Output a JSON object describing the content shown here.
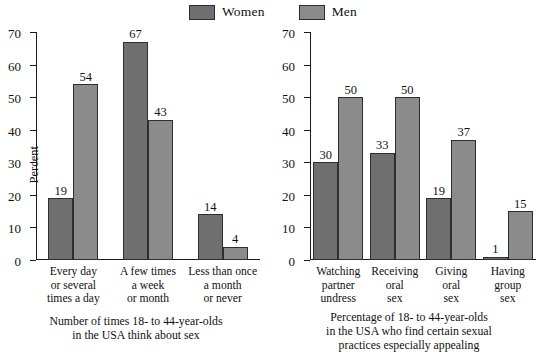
{
  "legend": {
    "items": [
      {
        "label": "Women",
        "color": "#6f6f6f",
        "key": "women"
      },
      {
        "label": "Men",
        "color": "#8b8b8b",
        "key": "men"
      }
    ]
  },
  "axis": {
    "ticks": [
      "70",
      "60",
      "50",
      "40",
      "30",
      "20",
      "10",
      "0"
    ],
    "ylabel": "Percent"
  },
  "panels": [
    {
      "id": "left",
      "ylabel": "Percent",
      "caption_line1": "Number of times 18- to 44-year-olds",
      "caption_line2": "in the USA think about sex",
      "caption_line3": "",
      "categories": [
        {
          "line1": "Every day",
          "line2": "or several",
          "line3": "times a day"
        },
        {
          "line1": "A few times",
          "line2": "a week",
          "line3": "or month"
        },
        {
          "line1": "Less than once",
          "line2": "a month",
          "line3": "or never"
        }
      ],
      "values": {
        "women": [
          19,
          67,
          14
        ],
        "men": [
          54,
          43,
          4
        ]
      },
      "labels": {
        "women": [
          "19",
          "67",
          "14"
        ],
        "men": [
          "54",
          "43",
          "4"
        ]
      }
    },
    {
      "id": "right",
      "ylabel": "",
      "caption_line1": "Percentage of 18- to 44-year-olds",
      "caption_line2": "in the USA who find certain sexual",
      "caption_line3": "practices especially appealing",
      "categories": [
        {
          "line1": "Watching",
          "line2": "partner",
          "line3": "undress"
        },
        {
          "line1": "Receiving",
          "line2": "oral",
          "line3": "sex"
        },
        {
          "line1": "Giving",
          "line2": "oral",
          "line3": "sex"
        },
        {
          "line1": "Having",
          "line2": "group",
          "line3": "sex"
        }
      ],
      "values": {
        "women": [
          30,
          33,
          19,
          1
        ],
        "men": [
          50,
          50,
          37,
          15
        ]
      },
      "labels": {
        "women": [
          "30",
          "33",
          "19",
          "1"
        ],
        "men": [
          "50",
          "50",
          "37",
          "15"
        ]
      }
    }
  ],
  "chart_data": [
    {
      "type": "bar",
      "title": "Number of times 18- to 44-year-olds in the USA think about sex",
      "xlabel": "Number of times 18- to 44-year-olds in the USA think about sex",
      "ylabel": "Percent",
      "ylim": [
        0,
        70
      ],
      "yticks": [
        0,
        10,
        20,
        30,
        40,
        50,
        60,
        70
      ],
      "grid": false,
      "legend_position": "top-center",
      "categories": [
        "Every day or several times a day",
        "A few times a week or month",
        "Less than once a month or never"
      ],
      "series": [
        {
          "name": "Women",
          "values": [
            19,
            67,
            14
          ],
          "color": "#6f6f6f"
        },
        {
          "name": "Men",
          "values": [
            54,
            43,
            4
          ],
          "color": "#8b8b8b"
        }
      ]
    },
    {
      "type": "bar",
      "title": "Percentage of 18- to 44-year-olds in the USA who find certain sexual practices especially appealing",
      "xlabel": "Percentage of 18- to 44-year-olds in the USA who find certain sexual practices especially appealing",
      "ylabel": "Percent",
      "ylim": [
        0,
        70
      ],
      "yticks": [
        0,
        10,
        20,
        30,
        40,
        50,
        60,
        70
      ],
      "grid": false,
      "legend_position": "top-center",
      "categories": [
        "Watching partner undress",
        "Receiving oral sex",
        "Giving oral sex",
        "Having group sex"
      ],
      "series": [
        {
          "name": "Women",
          "values": [
            30,
            33,
            19,
            1
          ],
          "color": "#6f6f6f"
        },
        {
          "name": "Men",
          "values": [
            50,
            50,
            37,
            15
          ],
          "color": "#8b8b8b"
        }
      ]
    }
  ]
}
